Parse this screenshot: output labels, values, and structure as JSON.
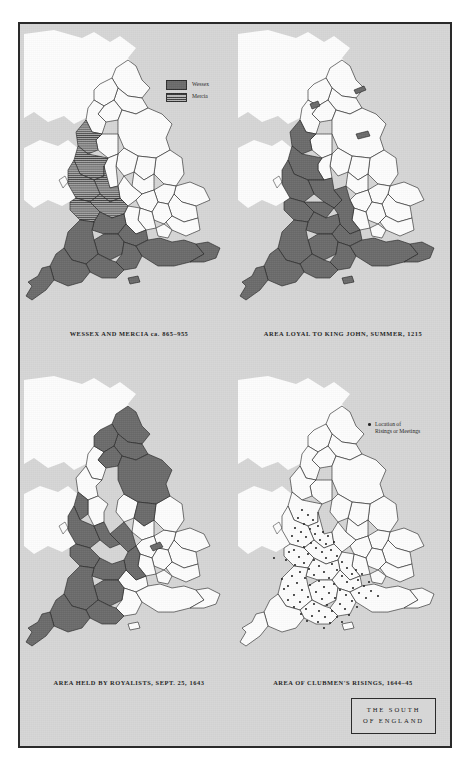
{
  "figure": {
    "title_line1": "THE  SOUTH",
    "title_line2": "OF ENGLAND",
    "background_color": "#d6d6d6",
    "frame_color": "#2a2a2a",
    "fill_color": "#6a6a6a",
    "unfilled_color": "#fdfdfd",
    "outline_color": "#1f1f1f",
    "dot_color": "#242424"
  },
  "panels": [
    {
      "id": "wessex-mercia",
      "caption": "WESSEX AND MERCIA ca. 865–955",
      "legend": {
        "items": [
          {
            "label": "Wessex",
            "style": "solid"
          },
          {
            "label": "Mercia",
            "style": "hatched"
          }
        ]
      }
    },
    {
      "id": "king-john",
      "caption": "AREA LOYAL TO KING JOHN, SUMMER, 1215",
      "legend": null
    },
    {
      "id": "royalists",
      "caption": "AREA HELD BY ROYALISTS, SEPT. 25, 1643",
      "legend": null
    },
    {
      "id": "clubmen",
      "caption": "AREA OF CLUBMEN'S RISINGS, 1644–45",
      "legend": {
        "marker": "dot",
        "label_line1": "Location of",
        "label_line2": "Risings or Meetings"
      }
    }
  ]
}
